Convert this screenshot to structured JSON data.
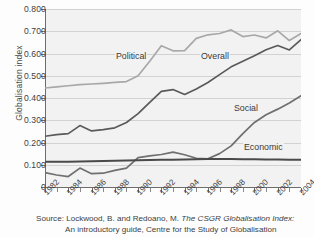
{
  "chart_data": {
    "type": "line",
    "title": "",
    "xlabel": "",
    "ylabel": "Globalisation index",
    "ylim": [
      0,
      0.8
    ],
    "ytick_labels": [
      "0.800",
      "0.700",
      "0.600",
      "0.500",
      "0.400",
      "0.300",
      "0.200",
      "0.100",
      "0"
    ],
    "ytick_values": [
      0.8,
      0.7,
      0.6,
      0.5,
      0.4,
      0.3,
      0.2,
      0.1,
      0
    ],
    "xlim": [
      1982,
      2004
    ],
    "xtick_labels": [
      "1982",
      "1984",
      "1986",
      "1988",
      "1990",
      "1992",
      "1994",
      "1996",
      "1998",
      "2000",
      "2002",
      "2004"
    ],
    "xtick_values": [
      1982,
      1984,
      1986,
      1988,
      1990,
      1992,
      1994,
      1996,
      1998,
      2000,
      2002,
      2004
    ],
    "x": [
      1982,
      1983,
      1984,
      1985,
      1986,
      1987,
      1988,
      1989,
      1990,
      1991,
      1992,
      1993,
      1994,
      1995,
      1996,
      1997,
      1998,
      1999,
      2000,
      2001,
      2002,
      2003,
      2004
    ],
    "grid": "horizontal",
    "legend_position": "inline-labels",
    "series": [
      {
        "name": "Political",
        "color": "#a8a8a8",
        "values": [
          0.445,
          0.45,
          0.455,
          0.46,
          0.463,
          0.466,
          0.47,
          0.474,
          0.5,
          0.565,
          0.635,
          0.612,
          0.613,
          0.668,
          0.684,
          0.69,
          0.706,
          0.676,
          0.683,
          0.67,
          0.702,
          0.658,
          0.69
        ]
      },
      {
        "name": "Overall",
        "color": "#5a5a5a",
        "values": [
          0.228,
          0.235,
          0.24,
          0.276,
          0.252,
          0.258,
          0.266,
          0.29,
          0.33,
          0.38,
          0.43,
          0.438,
          0.416,
          0.44,
          0.47,
          0.505,
          0.54,
          0.565,
          0.59,
          0.617,
          0.636,
          0.616,
          0.662
        ]
      },
      {
        "name": "Social",
        "color": "#6f6f6f",
        "values": [
          0.065,
          0.054,
          0.047,
          0.085,
          0.06,
          0.062,
          0.075,
          0.085,
          0.132,
          0.14,
          0.146,
          0.157,
          0.145,
          0.129,
          0.127,
          0.15,
          0.185,
          0.24,
          0.29,
          0.325,
          0.35,
          0.378,
          0.41
        ]
      },
      {
        "name": "Economic",
        "color": "#4a4a4a",
        "values": [
          0.113,
          0.113,
          0.114,
          0.115,
          0.116,
          0.117,
          0.118,
          0.119,
          0.12,
          0.121,
          0.122,
          0.123,
          0.124,
          0.125,
          0.126,
          0.126,
          0.126,
          0.125,
          0.125,
          0.124,
          0.124,
          0.123,
          0.123
        ]
      }
    ]
  },
  "labels": {
    "political": "Political",
    "overall": "Overall",
    "social": "Social",
    "economic": "Economic"
  },
  "source": {
    "prefix": "Source:",
    "line1_plain": "Lockwood, B. and Redoano, M. ",
    "line1_italic": "The CSGR Globalisation Index:",
    "line2": "An introductory guide, Centre for the Study of Globalisation"
  }
}
